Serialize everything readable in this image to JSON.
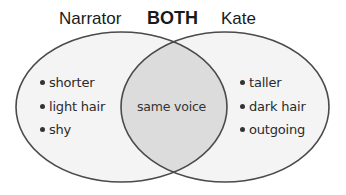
{
  "headings": {
    "left": "Narrator",
    "center": "BOTH",
    "right": "Kate"
  },
  "sets": {
    "left": {
      "name": "Narrator",
      "items": [
        "shorter",
        "light hair",
        "shy"
      ]
    },
    "intersection": {
      "name": "BOTH",
      "items": [
        "same voice"
      ]
    },
    "right": {
      "name": "Kate",
      "items": [
        "taller",
        "dark hair",
        "outgoing"
      ]
    }
  },
  "colors": {
    "outline": "#4a4a4a",
    "fill": "#f3f3f3",
    "overlap_fill": "#dcdcdc",
    "text": "#2a2a2a"
  }
}
